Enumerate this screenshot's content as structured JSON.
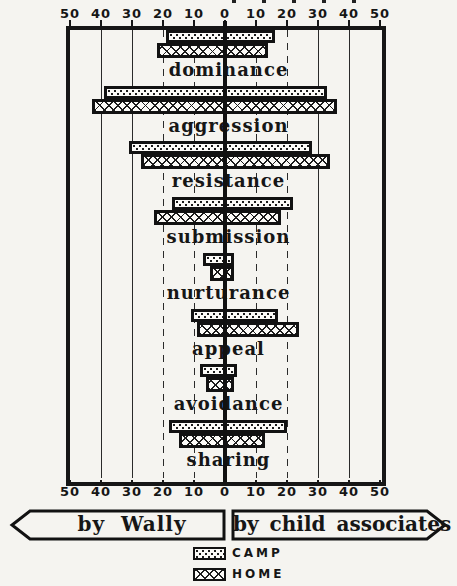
{
  "colors": {
    "ink": "#161616",
    "paper": "#f5f4f0",
    "bar_fill": "#fcfbf8"
  },
  "footer": {
    "left_banner": "by Wally",
    "right_banner": "by child associates"
  },
  "legend": {
    "camp_label": "CAMP",
    "home_label": "HOME"
  },
  "chart_data": {
    "type": "bar",
    "variant": "horizontal-diverging",
    "title": "",
    "axis": {
      "tick_labels": [
        "50",
        "40",
        "30",
        "20",
        "10",
        "0",
        "10",
        "20",
        "30",
        "40",
        "50"
      ],
      "max_each_side": 50,
      "labels_shown": "top and bottom",
      "left_side_meaning": "by Wally",
      "right_side_meaning": "by child associates",
      "grid": "vertical lines at every 10 units"
    },
    "categories": [
      "dominance",
      "aggression",
      "resistance",
      "submission",
      "nurturance",
      "appeal",
      "avoidance",
      "sharing"
    ],
    "series": [
      {
        "name": "CAMP",
        "pattern": "dots",
        "bars": [
          {
            "left": 19,
            "right": 16
          },
          {
            "left": 39,
            "right": 33
          },
          {
            "left": 31,
            "right": 28
          },
          {
            "left": 17,
            "right": 22
          },
          {
            "left": 7,
            "right": 3
          },
          {
            "left": 11,
            "right": 17
          },
          {
            "left": 8,
            "right": 4
          },
          {
            "left": 18,
            "right": 20
          }
        ]
      },
      {
        "name": "HOME",
        "pattern": "crosshatch",
        "bars": [
          {
            "left": 22,
            "right": 14
          },
          {
            "left": 43,
            "right": 36
          },
          {
            "left": 27,
            "right": 34
          },
          {
            "left": 23,
            "right": 18
          },
          {
            "left": 5,
            "right": 3
          },
          {
            "left": 9,
            "right": 24
          },
          {
            "left": 6,
            "right": 3
          },
          {
            "left": 15,
            "right": 13
          }
        ]
      }
    ],
    "legend_position": "bottom center"
  }
}
